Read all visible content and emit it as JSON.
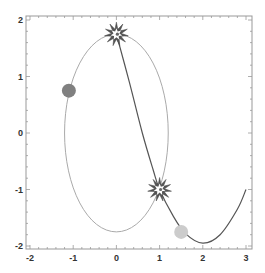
{
  "chart_data": {
    "type": "line",
    "title": "",
    "xlabel": "",
    "ylabel": "",
    "xlim": [
      -2,
      3
    ],
    "ylim": [
      -2,
      2
    ],
    "grid": false,
    "legend": null,
    "x_ticks": [
      "-2",
      "-1",
      "0",
      "1",
      "2",
      "3"
    ],
    "y_ticks": [
      "2",
      "1",
      "0",
      "-1",
      "-2"
    ],
    "series": [
      {
        "name": "ellipse",
        "kind": "parametric",
        "center": [
          0,
          0
        ],
        "radii": [
          1.2,
          1.75
        ],
        "color": "#aaaaaa"
      },
      {
        "name": "trajectory",
        "kind": "curve",
        "color": "#555555",
        "points": [
          [
            0,
            1.75
          ],
          [
            0.3,
            0.9
          ],
          [
            0.6,
            0.0
          ],
          [
            0.85,
            -0.65
          ],
          [
            1.0,
            -1.0
          ],
          [
            1.3,
            -1.45
          ],
          [
            1.6,
            -1.78
          ],
          [
            2.0,
            -1.95
          ],
          [
            2.4,
            -1.8
          ],
          [
            2.8,
            -1.35
          ],
          [
            3.0,
            -1.0
          ]
        ]
      }
    ],
    "markers": [
      {
        "name": "collision-top",
        "shape": "starburst",
        "x": 0.0,
        "y": 1.75,
        "color": "#555555"
      },
      {
        "name": "collision-bottom",
        "shape": "starburst",
        "x": 1.0,
        "y": -1.0,
        "color": "#555555"
      },
      {
        "name": "dark-ball",
        "shape": "circle",
        "x": -1.1,
        "y": 0.75,
        "color": "#808080"
      },
      {
        "name": "light-ball",
        "shape": "circle",
        "x": 1.5,
        "y": -1.75,
        "color": "#cccccc"
      }
    ]
  },
  "colors": {
    "frame": "#999999",
    "ellipse": "#aaaaaa",
    "trajectory": "#555555",
    "dark_ball": "#808080",
    "light_ball": "#cccccc",
    "star": "#555555"
  }
}
